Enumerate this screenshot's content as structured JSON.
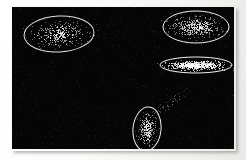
{
  "figure": {
    "title": "",
    "background_color": "#f7f7f5",
    "plot_background_color": "#050505",
    "point_color": "#ffffff",
    "ellipse_color": "#e8e8e8"
  },
  "chart_data": {
    "type": "scatter",
    "title": "",
    "subtitle": "",
    "xlabel": "",
    "ylabel": "",
    "xlim": [
      0,
      222
    ],
    "ylim": [
      0,
      142
    ],
    "grid": false,
    "axis_ticks": false,
    "legend": false,
    "legend_position": "none",
    "annotations": [],
    "point_size": 1,
    "total_points": 1420,
    "series": [
      {
        "name": "cluster-top-left",
        "label": "Cluster 1",
        "n_points": 330,
        "center": [
          47,
          27
        ],
        "ellipse": {
          "cx": 47,
          "cy": 27,
          "rx": 35,
          "ry": 18,
          "rotation_deg": -3,
          "stroke": "#e0e0e0",
          "fill": "none"
        },
        "spread": [
          28,
          13
        ],
        "density": "medium",
        "orientation": "horizontal-wide"
      },
      {
        "name": "cluster-top-right",
        "label": "Cluster 2",
        "n_points": 420,
        "center": [
          184,
          20
        ],
        "ellipse": {
          "cx": 184,
          "cy": 20,
          "rx": 33,
          "ry": 16,
          "rotation_deg": 0,
          "stroke": "#efefef",
          "fill": "none"
        },
        "spread": [
          26,
          11
        ],
        "density": "high",
        "orientation": "horizontal-wide"
      },
      {
        "name": "cluster-mid-right",
        "label": "Cluster 3",
        "n_points": 380,
        "center": [
          184,
          58
        ],
        "ellipse": {
          "cx": 184,
          "cy": 58,
          "rx": 36,
          "ry": 8,
          "rotation_deg": 0,
          "stroke": "#f2f2f2",
          "fill": "none"
        },
        "spread": [
          27,
          4
        ],
        "density": "very-high",
        "orientation": "horizontal-flat"
      },
      {
        "name": "cluster-bottom-center",
        "label": "Cluster 4",
        "n_points": 250,
        "center": [
          135,
          122
        ],
        "ellipse": {
          "cx": 135,
          "cy": 122,
          "rx": 14,
          "ry": 22,
          "rotation_deg": 6,
          "stroke": "#ededed",
          "fill": "none"
        },
        "spread": [
          9,
          17
        ],
        "density": "high",
        "orientation": "vertical-tall"
      },
      {
        "name": "cluster-bottom-tail",
        "label": "Cluster 4 tail",
        "n_points": 40,
        "center": [
          156,
          96
        ],
        "ellipse": null,
        "spread": [
          14,
          12
        ],
        "density": "sparse",
        "orientation": "diagonal-up-right"
      }
    ]
  }
}
